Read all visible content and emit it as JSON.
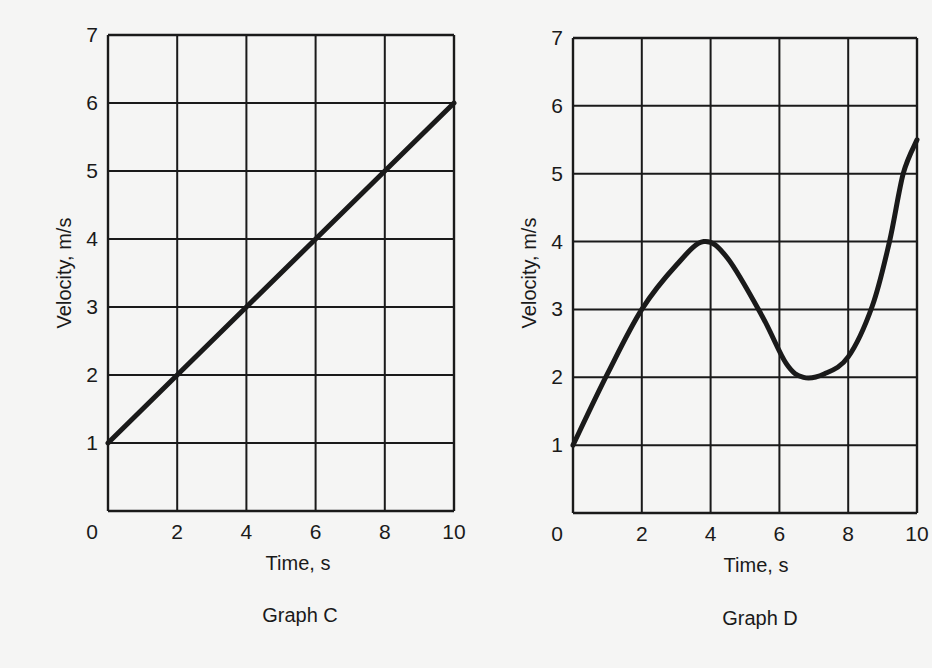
{
  "figure": {
    "background": "#f5f5f4",
    "ink": "#1a1a1a"
  },
  "chart_data": [
    {
      "type": "line",
      "title": "Graph C",
      "xlabel": "Time, s",
      "ylabel": "Velocity, m/s",
      "xlim": [
        0,
        10
      ],
      "ylim": [
        0,
        7
      ],
      "xticks": [
        0,
        2,
        4,
        6,
        8,
        10
      ],
      "yticks": [
        1,
        2,
        3,
        4,
        5,
        6,
        7
      ],
      "grid": true,
      "legend": null,
      "series": [
        {
          "name": "velocity",
          "x": [
            0,
            2,
            4,
            6,
            8,
            10
          ],
          "y": [
            1,
            2,
            3,
            4,
            5,
            6
          ]
        }
      ]
    },
    {
      "type": "line",
      "title": "Graph D",
      "xlabel": "Time, s",
      "ylabel": "Velocity, m/s",
      "xlim": [
        0,
        10
      ],
      "ylim": [
        0,
        7
      ],
      "xticks": [
        0,
        2,
        4,
        6,
        8,
        10
      ],
      "yticks": [
        1,
        2,
        3,
        4,
        5,
        6,
        7
      ],
      "grid": true,
      "legend": null,
      "series": [
        {
          "name": "velocity",
          "x": [
            0,
            1,
            2,
            3,
            3.8,
            4.5,
            5.5,
            6.2,
            6.7,
            7.3,
            8,
            8.7,
            9.2,
            9.6,
            10
          ],
          "y": [
            1,
            2.05,
            3,
            3.65,
            4,
            3.75,
            2.9,
            2.2,
            2,
            2.05,
            2.3,
            3.05,
            4,
            5,
            5.5
          ]
        }
      ]
    }
  ],
  "graphs": {
    "c": {
      "caption": "Graph C",
      "xlabel": "Time, s",
      "ylabel": "Velocity, m/s",
      "x_tick_labels": [
        "0",
        "2",
        "4",
        "6",
        "8",
        "10"
      ],
      "y_tick_labels": [
        "1",
        "2",
        "3",
        "4",
        "5",
        "6",
        "7"
      ]
    },
    "d": {
      "caption": "Graph D",
      "xlabel": "Time, s",
      "ylabel": "Velocity, m/s",
      "x_tick_labels": [
        "0",
        "2",
        "4",
        "6",
        "8",
        "10"
      ],
      "y_tick_labels": [
        "1",
        "2",
        "3",
        "4",
        "5",
        "6",
        "7"
      ]
    }
  }
}
